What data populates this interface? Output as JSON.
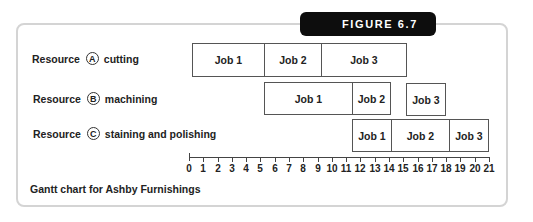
{
  "figure": {
    "badge": "FIGURE 6.7",
    "caption": "Gantt chart for Ashby Furnishings"
  },
  "resources": [
    {
      "word": "Resource",
      "letter": "A",
      "name": "cutting"
    },
    {
      "word": "Resource",
      "letter": "B",
      "name": "machining"
    },
    {
      "word": "Resource",
      "letter": "C",
      "name": "staining and polishing"
    }
  ],
  "axis": {
    "ticks": [
      "0",
      "1",
      "2",
      "3",
      "4",
      "5",
      "6",
      "7",
      "8",
      "9",
      "10",
      "11",
      "12",
      "13",
      "14",
      "15",
      "16",
      "17",
      "18",
      "19",
      "20",
      "21"
    ]
  },
  "bars": [
    {
      "label": "Job 1",
      "left": 192,
      "top": 43,
      "width": 73,
      "height": 34
    },
    {
      "label": "Job 2",
      "left": 264,
      "top": 43,
      "width": 58,
      "height": 34
    },
    {
      "label": "Job 3",
      "left": 321,
      "top": 43,
      "width": 86,
      "height": 34
    },
    {
      "label": "Job 1",
      "left": 264,
      "top": 82,
      "width": 89,
      "height": 33
    },
    {
      "label": "Job 2",
      "left": 352,
      "top": 82,
      "width": 39,
      "height": 33
    },
    {
      "label": "Job 3",
      "left": 406,
      "top": 83,
      "width": 40,
      "height": 33
    },
    {
      "label": "Job 1",
      "left": 352,
      "top": 119,
      "width": 40,
      "height": 33
    },
    {
      "label": "Job 2",
      "left": 391,
      "top": 119,
      "width": 59,
      "height": 33
    },
    {
      "label": "Job 3",
      "left": 449,
      "top": 119,
      "width": 40,
      "height": 33
    }
  ],
  "chart_data": {
    "type": "gantt",
    "title": "FIGURE 6.7",
    "caption": "Gantt chart for Ashby Furnishings",
    "xlabel": "",
    "ylabel": "",
    "xlim": [
      0,
      21
    ],
    "x_ticks": [
      0,
      1,
      2,
      3,
      4,
      5,
      6,
      7,
      8,
      9,
      10,
      11,
      12,
      13,
      14,
      15,
      16,
      17,
      18,
      19,
      20,
      21
    ],
    "grid": false,
    "categories": [
      "Resource A cutting",
      "Resource B machining",
      "Resource C staining and polishing"
    ],
    "series": [
      {
        "name": "Resource A cutting",
        "tasks": [
          {
            "label": "Job 1",
            "start": 0,
            "end": 5
          },
          {
            "label": "Job 2",
            "start": 5,
            "end": 9
          },
          {
            "label": "Job 3",
            "start": 9,
            "end": 15
          }
        ]
      },
      {
        "name": "Resource B machining",
        "tasks": [
          {
            "label": "Job 1",
            "start": 5,
            "end": 11
          },
          {
            "label": "Job 2",
            "start": 11,
            "end": 14
          },
          {
            "label": "Job 3",
            "start": 15,
            "end": 18
          }
        ]
      },
      {
        "name": "Resource C staining and polishing",
        "tasks": [
          {
            "label": "Job 1",
            "start": 11,
            "end": 14
          },
          {
            "label": "Job 2",
            "start": 14,
            "end": 18
          },
          {
            "label": "Job 3",
            "start": 18,
            "end": 21
          }
        ]
      }
    ]
  }
}
